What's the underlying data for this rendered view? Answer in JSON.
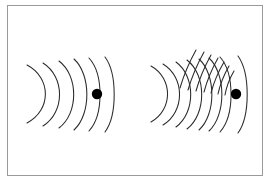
{
  "figure": {
    "title": "",
    "background_color": "#ffffff",
    "border_color": "#9a9a9a",
    "stroke_color": "#2a2a2a",
    "dot_color": "#000000",
    "frame": {
      "x": 7,
      "y": 5,
      "width": 256,
      "height": 171
    }
  },
  "chart_data": {
    "type": "diagram",
    "title": "",
    "subtitle": "",
    "xlabel": "",
    "ylabel": "",
    "panels": [
      {
        "name": "stationary-source",
        "label": "",
        "source": {
          "x": 97,
          "y": 94,
          "radius": 5.2
        },
        "arc_count": 6,
        "fan_count": 0,
        "arcs": [
          {
            "cx": 37,
            "cy": 94,
            "rx": 10,
            "ry": 30,
            "sweep_deg": 150,
            "top": 65,
            "bottom": 123
          },
          {
            "cx": 52,
            "cy": 94,
            "rx": 9,
            "ry": 32,
            "top": 63,
            "bottom": 126
          },
          {
            "cx": 67,
            "cy": 94,
            "rx": 8,
            "ry": 34,
            "top": 61,
            "bottom": 128
          },
          {
            "cx": 81,
            "cy": 94,
            "rx": 7,
            "ry": 36,
            "top": 59,
            "bottom": 130
          },
          {
            "cx": 95,
            "cy": 94,
            "rx": 6,
            "ry": 37,
            "top": 58,
            "bottom": 131
          },
          {
            "cx": 110,
            "cy": 94,
            "rx": 5,
            "ry": 38,
            "top": 57,
            "bottom": 132
          }
        ]
      },
      {
        "name": "moving-source",
        "label": "",
        "source": {
          "x": 236,
          "y": 94,
          "radius": 5.2
        },
        "arc_count": 8,
        "fan_count": 7,
        "arcs": [
          {
            "cx": 160,
            "cy": 94,
            "rx": 9,
            "ry": 29,
            "top": 66,
            "bottom": 122
          },
          {
            "cx": 172,
            "cy": 94,
            "rx": 9,
            "ry": 31,
            "top": 64,
            "bottom": 125
          },
          {
            "cx": 184,
            "cy": 94,
            "rx": 8,
            "ry": 33,
            "top": 62,
            "bottom": 127
          },
          {
            "cx": 195,
            "cy": 94,
            "rx": 8,
            "ry": 35,
            "top": 60,
            "bottom": 129
          },
          {
            "cx": 206,
            "cy": 94,
            "rx": 7,
            "ry": 36,
            "top": 59,
            "bottom": 130
          },
          {
            "cx": 216,
            "cy": 94,
            "rx": 7,
            "ry": 37,
            "top": 58,
            "bottom": 131
          },
          {
            "cx": 226,
            "cy": 94,
            "rx": 6,
            "ry": 38,
            "top": 57,
            "bottom": 132
          },
          {
            "cx": 243,
            "cy": 94,
            "rx": 5,
            "ry": 39,
            "top": 56,
            "bottom": 133
          }
        ],
        "fan_lines": [
          {
            "x1": 180,
            "y1": 88,
            "x2": 196,
            "y2": 50
          },
          {
            "x1": 188,
            "y1": 90,
            "x2": 204,
            "y2": 52
          },
          {
            "x1": 196,
            "y1": 91,
            "x2": 211,
            "y2": 55
          },
          {
            "x1": 204,
            "y1": 92,
            "x2": 218,
            "y2": 58
          },
          {
            "x1": 211,
            "y1": 93,
            "x2": 224,
            "y2": 62
          },
          {
            "x1": 218,
            "y1": 94,
            "x2": 229,
            "y2": 66
          },
          {
            "x1": 225,
            "y1": 95,
            "x2": 234,
            "y2": 71
          }
        ]
      }
    ],
    "legend": [],
    "annotations": [],
    "grid": false
  }
}
